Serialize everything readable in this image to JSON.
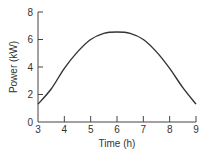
{
  "chart_data": {
    "type": "line",
    "title": "",
    "xlabel": "Time (h)",
    "ylabel": "Power (kW)",
    "xlim": [
      3,
      9
    ],
    "ylim": [
      0,
      8
    ],
    "x_ticks": [
      3,
      4,
      5,
      6,
      7,
      8,
      9
    ],
    "y_ticks": [
      0,
      2,
      4,
      6,
      8
    ],
    "grid": false,
    "series": [
      {
        "name": "Power",
        "x": [
          3,
          3.5,
          4,
          4.5,
          5,
          5.5,
          6,
          6.5,
          7,
          7.5,
          8,
          8.5,
          9
        ],
        "values": [
          1.3,
          2.4,
          3.9,
          5.1,
          6.0,
          6.45,
          6.55,
          6.45,
          6.0,
          5.1,
          3.9,
          2.5,
          1.3
        ]
      }
    ],
    "color": "#333333"
  }
}
